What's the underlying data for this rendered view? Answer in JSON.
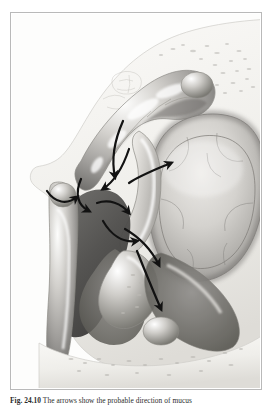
{
  "figure": {
    "frame": {
      "border_color": "#b9b9b9",
      "background": "#ffffff"
    },
    "caption": {
      "number": "Fig. 24.10",
      "text": "The arrows show the probable direction of mucus",
      "full": "Fig. 24.10  The arrows show the probable direction of mucus"
    },
    "illustration": {
      "title": "lateral-nasal-wall-mucociliary-drainage",
      "type": "medical-anatomical-illustration",
      "style": "grayscale airbrush rendering",
      "palette": {
        "bone_light": "#f2f1ee",
        "bone_mid": "#e2e1dc",
        "soft_tissue_light": "#d9d8d4",
        "soft_tissue_mid": "#a8a7a3",
        "soft_tissue_dark": "#6d6c69",
        "cavity_dark": "#4a4947",
        "cavity_darkest": "#3a3938",
        "highlight": "#ffffff",
        "arrow": "#141414",
        "outline": "#8b8a86",
        "antrum_fill": "#c9c8c4"
      },
      "structures": [
        {
          "name": "frontal-bone-region",
          "label": "frontal / superior bone shelf"
        },
        {
          "name": "superior-turbinate",
          "label": "superior turbinate"
        },
        {
          "name": "middle-turbinate",
          "label": "middle turbinate"
        },
        {
          "name": "inferior-turbinate",
          "label": "inferior turbinate"
        },
        {
          "name": "maxillary-antrum",
          "label": "maxillary antrum"
        },
        {
          "name": "ethmoid-air-cells",
          "label": "ethmoid air cells"
        },
        {
          "name": "nasal-floor",
          "label": "nasal floor / hard palate"
        },
        {
          "name": "nasal-vestibule",
          "label": "nasal vestibule"
        },
        {
          "name": "ostiomeatal-complex",
          "label": "ostiomeatal complex"
        }
      ],
      "arrows": [
        {
          "name": "arrow-superior-meatus",
          "direction": "downward-curving"
        },
        {
          "name": "arrow-middle-meatus-anterior",
          "direction": "leftward-curving"
        },
        {
          "name": "arrow-middle-meatus-posterior",
          "direction": "upward-right"
        },
        {
          "name": "arrow-inferior-turbinate-over",
          "direction": "leftward-hook"
        },
        {
          "name": "arrow-antrum-outflow",
          "direction": "downward-left"
        },
        {
          "name": "arrow-nasal-floor",
          "direction": "downward-right"
        },
        {
          "name": "arrow-posterior-choana",
          "direction": "rightward"
        },
        {
          "name": "arrow-vestibule-loop",
          "direction": "curved-loop"
        }
      ]
    }
  }
}
